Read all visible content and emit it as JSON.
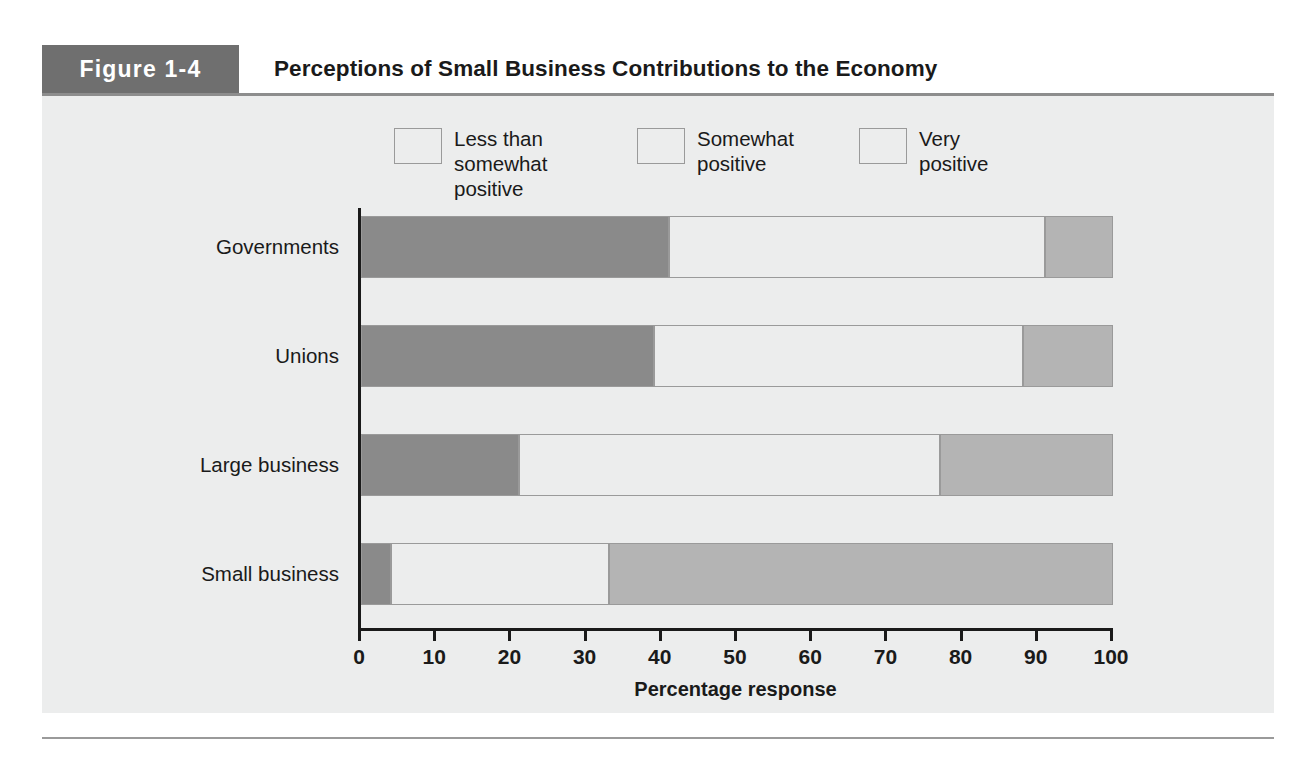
{
  "figure": {
    "tag": "Figure 1-4",
    "title": "Perceptions of Small Business Contributions to the Economy"
  },
  "chart_data": {
    "type": "bar",
    "orientation": "horizontal",
    "stacked": true,
    "title": "Perceptions of Small Business Contributions to the Economy",
    "xlabel": "Percentage response",
    "ylabel": "",
    "xlim": [
      0,
      100
    ],
    "xticks": [
      "0",
      "10",
      "20",
      "30",
      "40",
      "50",
      "60",
      "70",
      "80",
      "90",
      "100"
    ],
    "grid": false,
    "legend_position": "top",
    "categories": [
      "Governments",
      "Unions",
      "Large business",
      "Small business"
    ],
    "series": [
      {
        "name": "Less than somewhat positive",
        "color": "#8a8a8a",
        "values": [
          41,
          39,
          21,
          4
        ]
      },
      {
        "name": "Somewhat positive",
        "color": "#eceded",
        "values": [
          50,
          49,
          56,
          29
        ]
      },
      {
        "name": "Very positive",
        "color": "#b4b4b4",
        "values": [
          9,
          12,
          23,
          67
        ]
      }
    ]
  },
  "legend": [
    {
      "label": "Less than\nsomewhat\npositive",
      "color": "#8a8a8a"
    },
    {
      "label": "Somewhat\npositive",
      "color": "#eceded"
    },
    {
      "label": "Very\npositive",
      "color": "#b4b4b4"
    }
  ],
  "axis": {
    "x_title": "Percentage response",
    "x_ticks": [
      "0",
      "10",
      "20",
      "30",
      "40",
      "50",
      "60",
      "70",
      "80",
      "90",
      "100"
    ]
  },
  "categories": [
    "Governments",
    "Unions",
    "Large business",
    "Small business"
  ]
}
